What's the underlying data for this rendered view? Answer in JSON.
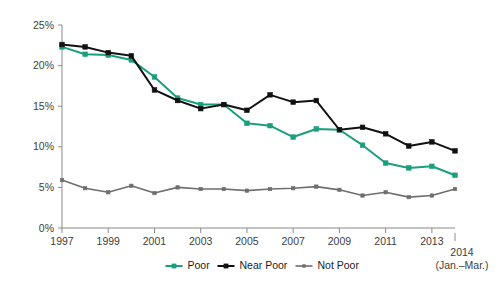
{
  "chart_data": {
    "type": "line",
    "title": "",
    "subtitle": "",
    "xlabel": "",
    "ylabel": "",
    "x": [
      1997,
      1998,
      1999,
      2000,
      2001,
      2002,
      2003,
      2004,
      2005,
      2006,
      2007,
      2008,
      2009,
      2010,
      2011,
      2012,
      2013,
      2014
    ],
    "x_tick_labels": [
      "1997",
      "1999",
      "2001",
      "2003",
      "2005",
      "2007",
      "2009",
      "2011",
      "2013"
    ],
    "x_tick_values": [
      1997,
      1999,
      2001,
      2003,
      2005,
      2007,
      2009,
      2011,
      2013
    ],
    "xlim": [
      1997,
      2014
    ],
    "y_tick_labels": [
      "0%",
      "5%",
      "10%",
      "15%",
      "20%",
      "25%"
    ],
    "y_tick_values": [
      0,
      5,
      10,
      15,
      20,
      25
    ],
    "ylim": [
      0,
      25
    ],
    "grid": false,
    "legend_position": "bottom",
    "series": [
      {
        "name": "Poor",
        "color": "#1a9e7e",
        "values": [
          22.3,
          21.4,
          21.3,
          20.7,
          18.6,
          16.0,
          15.2,
          15.2,
          12.9,
          12.6,
          11.2,
          12.2,
          12.1,
          10.2,
          8.0,
          7.4,
          7.6,
          6.5
        ]
      },
      {
        "name": "Near Poor",
        "color": "#111111",
        "values": [
          22.6,
          22.3,
          21.6,
          21.2,
          17.0,
          15.7,
          14.7,
          15.2,
          14.5,
          16.4,
          15.5,
          15.7,
          12.1,
          12.4,
          11.6,
          10.1,
          10.6,
          9.5
        ]
      },
      {
        "name": "Not Poor",
        "color": "#6e6e6e",
        "values": [
          5.9,
          4.9,
          4.4,
          5.2,
          4.3,
          5.0,
          4.8,
          4.8,
          4.6,
          4.8,
          4.9,
          5.1,
          4.7,
          4.0,
          4.4,
          3.8,
          4.0,
          4.8
        ]
      }
    ],
    "annotations": [
      {
        "name": "final-year-label",
        "line1": "2014",
        "line2": "(Jan.–Mar.)"
      }
    ]
  },
  "legend": {
    "items": [
      {
        "label": "Poor",
        "color": "#1a9e7e"
      },
      {
        "label": "Near Poor",
        "color": "#111111"
      },
      {
        "label": "Not Poor",
        "color": "#6e6e6e"
      }
    ]
  },
  "axes": {
    "y_labels": [
      "25%",
      "20%",
      "15%",
      "10%",
      "5%",
      "0%"
    ],
    "x_labels": [
      "1997",
      "1999",
      "2001",
      "2003",
      "2005",
      "2007",
      "2009",
      "2011",
      "2013"
    ]
  },
  "colors": {
    "poor": "#1a9e7e",
    "near_poor": "#111111",
    "not_poor": "#6e6e6e",
    "axis": "#8a8a8a",
    "text": "#3d3d3d",
    "background": "#ffffff"
  }
}
